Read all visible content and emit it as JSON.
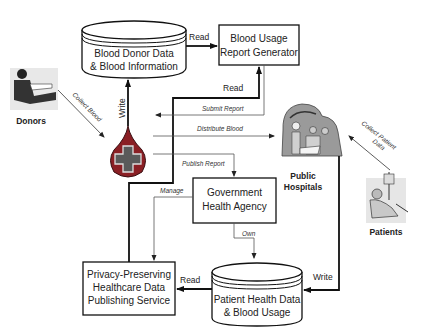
{
  "nodes": {
    "donor_db": {
      "line1": "Blood Donor Data",
      "line2": "& Blood Information"
    },
    "report_gen": {
      "line1": "Blood Usage",
      "line2": "Report Generator"
    },
    "gov_agency": {
      "line1": "Government",
      "line2": "Health Agency"
    },
    "ppdp_service": {
      "line1": "Privacy-Preserving",
      "line2": "Healthcare Data",
      "line3": "Publishing Service"
    },
    "patient_db": {
      "line1": "Patient Health Data",
      "line2": "& Blood Usage"
    },
    "donors": {
      "label": "Donors",
      "icon": "donor-person-icon"
    },
    "blood_bank": {
      "icon": "blood-drop-cross-icon"
    },
    "hospitals": {
      "line1": "Public",
      "line2": "Hospitals",
      "icon": "surgery-team-icon"
    },
    "patients": {
      "label": "Patients",
      "icon": "patient-bed-icon"
    }
  },
  "edges": {
    "write_donor_db": "Write",
    "read_donor_db": "Read",
    "read_report": "Read",
    "submit_report": "Submit Report",
    "distribute_blood": "Distribute Blood",
    "publish_report": "Publish Report",
    "collect_blood": "Collect Blood",
    "collect_patient_data_1": "Collect Patient",
    "collect_patient_data_2": "Data",
    "manage": "Manage",
    "own": "Own",
    "write_patient_db": "Write",
    "read_patient_db": "Read"
  },
  "colors": {
    "blood_drop": "#8a1f24",
    "cross_fill": "#5a5a5a",
    "stroke": "#111111"
  }
}
